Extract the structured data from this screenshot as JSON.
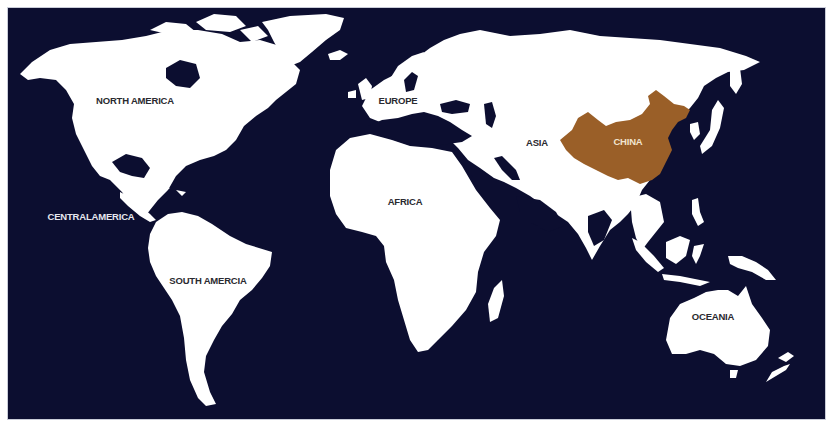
{
  "map": {
    "type": "world-continents",
    "highlighted_region": "China",
    "colors": {
      "ocean": "#0c0e30",
      "land": "#ffffff",
      "highlight": "#9a5f28",
      "frame_border": "#c9ccd8",
      "page_background": "#ffffff"
    }
  },
  "labels": {
    "north_america": "NORTH AMERICA",
    "central_america": "CENTRALAMERICA",
    "south_america": "SOUTH AMERCIA",
    "europe": "EUROPE",
    "africa": "AFRICA",
    "asia": "ASIA",
    "china": "CHINA",
    "oceania": "OCEANIA"
  }
}
